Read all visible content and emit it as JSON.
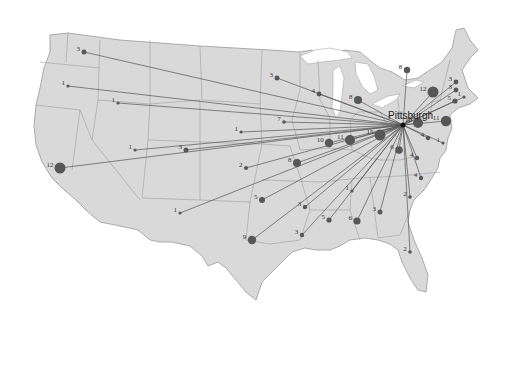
{
  "map": {
    "title": "",
    "hub": {
      "name": "Pittsburgh",
      "x": 403,
      "y": 125
    },
    "colors": {
      "land": "#d9d9d9",
      "border": "#9e9e9e",
      "flow": "#555555",
      "dot": "#575757",
      "water": "#ffffff"
    },
    "origins": [
      {
        "label": "3",
        "x": 84,
        "y": 52,
        "r": 2.5
      },
      {
        "label": "1",
        "x": 68,
        "y": 86,
        "r": 1.6
      },
      {
        "label": "1",
        "x": 118,
        "y": 103,
        "r": 1.6
      },
      {
        "label": "12",
        "x": 60,
        "y": 168,
        "r": 5.5
      },
      {
        "label": "1",
        "x": 135,
        "y": 150,
        "r": 1.6
      },
      {
        "label": "3",
        "x": 186,
        "y": 150,
        "r": 2.5
      },
      {
        "label": "1",
        "x": 241,
        "y": 132,
        "r": 1.6
      },
      {
        "label": "1",
        "x": 180,
        "y": 213,
        "r": 1.6
      },
      {
        "label": "9",
        "x": 252,
        "y": 240,
        "r": 4.2
      },
      {
        "label": "5",
        "x": 262,
        "y": 200,
        "r": 3
      },
      {
        "label": "2",
        "x": 246,
        "y": 168,
        "r": 2
      },
      {
        "label": "8",
        "x": 297,
        "y": 163,
        "r": 4
      },
      {
        "label": "7",
        "x": 284,
        "y": 122,
        "r": 1.8
      },
      {
        "label": "3",
        "x": 277,
        "y": 78,
        "r": 2.5
      },
      {
        "label": "4",
        "x": 319,
        "y": 94,
        "r": 2.4
      },
      {
        "label": "8",
        "x": 358,
        "y": 100,
        "r": 4
      },
      {
        "label": "8",
        "x": 407,
        "y": 70,
        "r": 3.2
      },
      {
        "label": "10",
        "x": 329,
        "y": 143,
        "r": 4.2
      },
      {
        "label": "11",
        "x": 350,
        "y": 140,
        "r": 5
      },
      {
        "label": "15",
        "x": 380,
        "y": 135,
        "r": 5.5
      },
      {
        "label": "6",
        "x": 399,
        "y": 150,
        "r": 3.8
      },
      {
        "label": "4",
        "x": 417,
        "y": 158,
        "r": 2.2
      },
      {
        "label": "4",
        "x": 421,
        "y": 178,
        "r": 2.2
      },
      {
        "label": "2",
        "x": 410,
        "y": 197,
        "r": 1.8
      },
      {
        "label": "1",
        "x": 352,
        "y": 191,
        "r": 1.6
      },
      {
        "label": "3",
        "x": 305,
        "y": 207,
        "r": 2.2
      },
      {
        "label": "5",
        "x": 329,
        "y": 220,
        "r": 2.6
      },
      {
        "label": "6",
        "x": 357,
        "y": 221,
        "r": 3.6
      },
      {
        "label": "3",
        "x": 380,
        "y": 212,
        "r": 2.5
      },
      {
        "label": "2",
        "x": 410,
        "y": 252,
        "r": 1.8
      },
      {
        "label": "3",
        "x": 302,
        "y": 235,
        "r": 2.2
      },
      {
        "label": "12",
        "x": 433,
        "y": 92,
        "r": 5.5
      },
      {
        "label": "10",
        "x": 418,
        "y": 123,
        "r": 5
      },
      {
        "label": "11",
        "x": 446,
        "y": 121,
        "r": 5.2
      },
      {
        "label": "4",
        "x": 428,
        "y": 138,
        "r": 2.2
      },
      {
        "label": "1",
        "x": 443,
        "y": 143,
        "r": 1.6
      },
      {
        "label": "3",
        "x": 456,
        "y": 82,
        "r": 2.4
      },
      {
        "label": "3",
        "x": 456,
        "y": 90,
        "r": 2.4
      },
      {
        "label": "5",
        "x": 455,
        "y": 101,
        "r": 2.6
      },
      {
        "label": "1",
        "x": 464,
        "y": 97,
        "r": 1.6
      }
    ]
  }
}
